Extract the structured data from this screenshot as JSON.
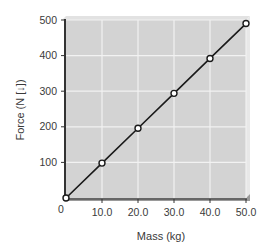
{
  "chart_data": {
    "type": "line",
    "title": "",
    "xlabel": "Mass (kg)",
    "ylabel": "Force (N [↓])",
    "xlim": [
      0,
      50
    ],
    "ylim": [
      0,
      500
    ],
    "x_ticks": [
      "0",
      "10.0",
      "20.0",
      "30.0",
      "40.0",
      "50.0"
    ],
    "y_ticks": [
      "100",
      "200",
      "300",
      "400",
      "500"
    ],
    "grid": true,
    "series": [
      {
        "name": "Force vs Mass",
        "x": [
          0,
          10,
          20,
          30,
          40,
          50
        ],
        "values": [
          0,
          98,
          196,
          294,
          392,
          490
        ],
        "marker": "open-circle"
      }
    ],
    "colors": {
      "plot_background": "#d3d3d3",
      "grid": "#f2f2f2",
      "line": "#1a1a1a",
      "axis": "#333333"
    }
  }
}
